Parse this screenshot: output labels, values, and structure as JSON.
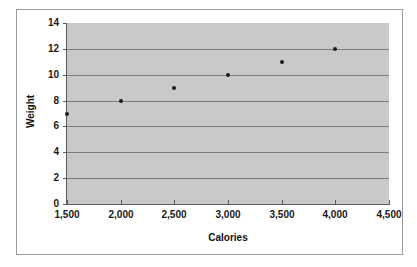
{
  "chart_data": {
    "type": "scatter",
    "title": "",
    "xlabel": "Calories",
    "ylabel": "Weight",
    "x": [
      1500,
      2000,
      2500,
      3000,
      3500,
      4000
    ],
    "values": [
      7,
      8,
      9,
      10,
      11,
      12
    ],
    "points": [
      {
        "x": 1500,
        "y": 7
      },
      {
        "x": 2000,
        "y": 8
      },
      {
        "x": 2500,
        "y": 9
      },
      {
        "x": 3000,
        "y": 10
      },
      {
        "x": 3500,
        "y": 11
      },
      {
        "x": 4000,
        "y": 12
      }
    ],
    "xlim": [
      1500,
      4500
    ],
    "ylim": [
      0,
      14
    ],
    "xtick_step": 500,
    "ytick_step": 2,
    "xticks": [
      1500,
      2000,
      2500,
      3000,
      3500,
      4000,
      4500
    ],
    "xtick_labels": [
      "1,500",
      "2,000",
      "2,500",
      "3,000",
      "3,500",
      "4,000",
      "4,500"
    ],
    "yticks": [
      0,
      2,
      4,
      6,
      8,
      10,
      12,
      14
    ],
    "ytick_labels": [
      "0",
      "2",
      "4",
      "6",
      "8",
      "10",
      "12",
      "14"
    ],
    "grid": {
      "horizontal": true,
      "vertical": false
    },
    "legend": {
      "visible": false,
      "position": "none"
    },
    "colors": {
      "plot_background": "#c9c9c9",
      "chart_background": "#ffffff",
      "gridline": "#7d7d7d",
      "axis_line": "#5a5a5a",
      "marker": "#1c1c1c",
      "frame_border": "#9a9a9a",
      "text": "#111111"
    }
  }
}
